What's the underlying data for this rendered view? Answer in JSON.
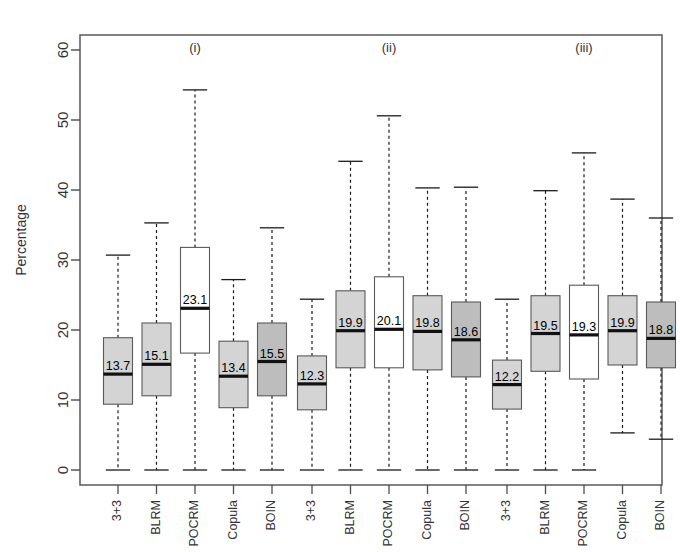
{
  "figure": {
    "ylabel": "Percentage",
    "panel_labels": [
      "(i)",
      "(ii)",
      "(iii)"
    ],
    "y_ticks": [
      0,
      10,
      20,
      30,
      40,
      50,
      60
    ],
    "colors": {
      "box_light": "#d4d4d4",
      "box_white": "#ffffff",
      "box_dark": "#bdbdbd",
      "line": "#1a1a1a",
      "frame": "#4d4d4d"
    }
  },
  "chart_data": {
    "type": "box",
    "title": "",
    "xlabel": "",
    "ylabel": "Percentage",
    "ylim": [
      0,
      62
    ],
    "y_ticks": [
      0,
      10,
      20,
      30,
      40,
      50,
      60
    ],
    "grid": false,
    "legend": "none",
    "groups": [
      "(i)",
      "(ii)",
      "(iii)"
    ],
    "categories": [
      "3+3",
      "BLRM",
      "POCRM",
      "Copula",
      "BOIN"
    ],
    "median_labels": [
      [
        "13.7",
        "15.1",
        "23.1",
        "13.4",
        "15.5"
      ],
      [
        "12.3",
        "19.9",
        "20.1",
        "19.8",
        "18.6"
      ],
      [
        "12.2",
        "19.5",
        "19.3",
        "19.9",
        "18.8"
      ]
    ],
    "boxes": [
      {
        "group": "(i)",
        "category": "3+3",
        "fill": "light",
        "lower_whisker": 0.0,
        "q1": 9.4,
        "median": 13.7,
        "q3": 18.9,
        "upper_whisker": 30.7
      },
      {
        "group": "(i)",
        "category": "BLRM",
        "fill": "light",
        "lower_whisker": 0.0,
        "q1": 10.6,
        "median": 15.1,
        "q3": 21.0,
        "upper_whisker": 35.3
      },
      {
        "group": "(i)",
        "category": "POCRM",
        "fill": "white",
        "lower_whisker": 0.0,
        "q1": 16.7,
        "median": 23.1,
        "q3": 31.8,
        "upper_whisker": 54.3
      },
      {
        "group": "(i)",
        "category": "Copula",
        "fill": "light",
        "lower_whisker": 0.0,
        "q1": 8.9,
        "median": 13.4,
        "q3": 18.4,
        "upper_whisker": 27.2
      },
      {
        "group": "(i)",
        "category": "BOIN",
        "fill": "dark",
        "lower_whisker": 0.0,
        "q1": 10.6,
        "median": 15.5,
        "q3": 21.0,
        "upper_whisker": 34.6
      },
      {
        "group": "(ii)",
        "category": "3+3",
        "fill": "light",
        "lower_whisker": 0.0,
        "q1": 8.6,
        "median": 12.3,
        "q3": 16.3,
        "upper_whisker": 24.4
      },
      {
        "group": "(ii)",
        "category": "BLRM",
        "fill": "light",
        "lower_whisker": 0.0,
        "q1": 14.6,
        "median": 19.9,
        "q3": 25.6,
        "upper_whisker": 44.1
      },
      {
        "group": "(ii)",
        "category": "POCRM",
        "fill": "white",
        "lower_whisker": 0.0,
        "q1": 14.6,
        "median": 20.1,
        "q3": 27.6,
        "upper_whisker": 50.6
      },
      {
        "group": "(ii)",
        "category": "Copula",
        "fill": "light",
        "lower_whisker": 0.0,
        "q1": 14.3,
        "median": 19.8,
        "q3": 24.9,
        "upper_whisker": 40.3
      },
      {
        "group": "(ii)",
        "category": "BOIN",
        "fill": "dark",
        "lower_whisker": 0.0,
        "q1": 13.3,
        "median": 18.6,
        "q3": 24.0,
        "upper_whisker": 40.4
      },
      {
        "group": "(iii)",
        "category": "3+3",
        "fill": "light",
        "lower_whisker": 0.0,
        "q1": 8.7,
        "median": 12.2,
        "q3": 15.7,
        "upper_whisker": 24.4
      },
      {
        "group": "(iii)",
        "category": "BLRM",
        "fill": "light",
        "lower_whisker": 0.0,
        "q1": 14.1,
        "median": 19.5,
        "q3": 24.9,
        "upper_whisker": 39.9
      },
      {
        "group": "(iii)",
        "category": "POCRM",
        "fill": "white",
        "lower_whisker": 0.0,
        "q1": 13.0,
        "median": 19.3,
        "q3": 26.4,
        "upper_whisker": 45.3
      },
      {
        "group": "(iii)",
        "category": "Copula",
        "fill": "light",
        "lower_whisker": 5.3,
        "q1": 15.0,
        "median": 19.9,
        "q3": 24.9,
        "upper_whisker": 38.7
      },
      {
        "group": "(iii)",
        "category": "BOIN",
        "fill": "dark",
        "lower_whisker": 4.4,
        "q1": 14.6,
        "median": 18.8,
        "q3": 24.0,
        "upper_whisker": 36.0
      }
    ]
  }
}
